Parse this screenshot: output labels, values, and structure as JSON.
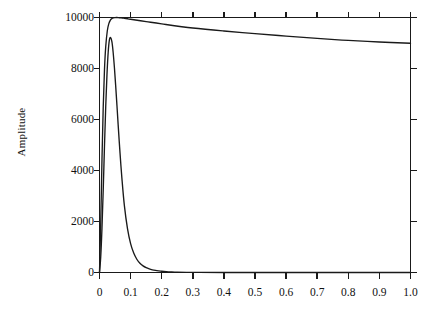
{
  "figure": {
    "background_color": "#ffffff",
    "line_color": "#1a1a1a",
    "axis_color": "#1a1a1a"
  },
  "axes": {
    "y_title": "Amplitude",
    "x_title": "",
    "y_tick_labels": [
      "0",
      "2000",
      "4000",
      "6000",
      "8000",
      "10000"
    ],
    "x_tick_labels": [
      "0",
      "0.1",
      "0.2",
      "0.3",
      "0.4",
      "0.5",
      "0.6",
      "0.7",
      "0.8",
      "0.9",
      "1.0"
    ]
  },
  "caption": "",
  "chart_data": {
    "type": "line",
    "title": "",
    "xlabel": "",
    "ylabel": "Amplitude",
    "xlim": [
      0,
      1.0
    ],
    "ylim": [
      0,
      10000
    ],
    "xticks": [
      0,
      0.1,
      0.2,
      0.3,
      0.4,
      0.5,
      0.6,
      0.7,
      0.8,
      0.9,
      1.0
    ],
    "yticks": [
      0,
      2000,
      4000,
      6000,
      8000,
      10000
    ],
    "xtick_labels": [
      "0",
      "0.1",
      "0.2",
      "0.3",
      "0.4",
      "0.5",
      "0.6",
      "0.7",
      "0.8",
      "0.9",
      "1.0"
    ],
    "ytick_labels": [
      "0",
      "2000",
      "4000",
      "6000",
      "8000",
      "10000"
    ],
    "grid": false,
    "legend": null,
    "frame": "box",
    "tick_direction": "out",
    "series": [
      {
        "name": "narrow-peak-curve",
        "color": "#1a1a1a",
        "x": [
          0.0,
          0.004,
          0.008,
          0.012,
          0.016,
          0.02,
          0.024,
          0.028,
          0.032,
          0.036,
          0.04,
          0.044,
          0.048,
          0.052,
          0.056,
          0.06,
          0.066,
          0.072,
          0.08,
          0.09,
          0.1,
          0.11,
          0.12,
          0.13,
          0.14,
          0.15,
          0.16,
          0.17,
          0.18,
          0.19,
          0.2,
          0.215,
          0.23,
          0.25,
          0.28,
          0.32,
          0.4,
          0.5,
          0.65,
          0.8,
          1.0
        ],
        "y": [
          0,
          620,
          1750,
          3250,
          4950,
          6500,
          7750,
          8650,
          9130,
          9210,
          9040,
          8620,
          8030,
          7330,
          6570,
          5790,
          4680,
          3700,
          2620,
          1720,
          1130,
          760,
          520,
          360,
          258,
          188,
          140,
          106,
          82,
          64,
          50,
          35,
          25,
          15,
          8,
          4,
          1,
          0,
          0,
          0,
          0
        ]
      },
      {
        "name": "broad-decay-curve",
        "color": "#1a1a1a",
        "x": [
          0.0,
          0.004,
          0.008,
          0.012,
          0.016,
          0.02,
          0.025,
          0.03,
          0.035,
          0.04,
          0.045,
          0.05,
          0.055,
          0.06,
          0.07,
          0.08,
          0.09,
          0.1,
          0.15,
          0.2,
          0.3,
          0.4,
          0.5,
          0.6,
          0.7,
          0.8,
          0.9,
          1.0
        ],
        "y": [
          0,
          1950,
          4450,
          6500,
          7950,
          8850,
          9470,
          9760,
          9900,
          9960,
          9985,
          9995,
          10000,
          9998,
          9985,
          9968,
          9950,
          9930,
          9840,
          9750,
          9590,
          9470,
          9370,
          9270,
          9180,
          9100,
          9040,
          8990
        ]
      }
    ],
    "annotations": [
      {
        "text": "peak of narrow curve",
        "x": 0.036,
        "y": 9210
      },
      {
        "text": "peak of broad curve",
        "x": 0.055,
        "y": 10000
      },
      {
        "text": "broad curve endpoint",
        "x": 1.0,
        "y": 8990
      }
    ]
  }
}
